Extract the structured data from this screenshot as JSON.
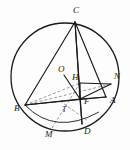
{
  "figure": {
    "kind": "geometry-diagram",
    "background_color": "#fdfdfd",
    "stroke_color": "#1a1a1a",
    "dashed_color": "#7a7a7a",
    "width": 130,
    "height": 150
  },
  "circle": {
    "name": "circumcircle",
    "cx": 65,
    "cy": 77,
    "r": 54,
    "stroke_width": 1.3
  },
  "points": [
    {
      "id": "C",
      "label": "C",
      "x": 75,
      "y": 22,
      "lx": 73,
      "ly": 13,
      "on_circle": true
    },
    {
      "id": "N",
      "label": "N",
      "x": 111,
      "y": 84,
      "lx": 114,
      "ly": 79,
      "on_circle": false
    },
    {
      "id": "A",
      "label": "A",
      "x": 106,
      "y": 97,
      "lx": 110,
      "ly": 103,
      "on_circle": true
    },
    {
      "id": "B",
      "label": "B",
      "x": 25,
      "y": 105,
      "lx": 14,
      "ly": 111,
      "on_circle": true
    },
    {
      "id": "D",
      "label": "D",
      "x": 82,
      "y": 124,
      "lx": 84,
      "ly": 134,
      "on_circle": true
    },
    {
      "id": "M",
      "label": "M",
      "x": 52,
      "y": 128,
      "lx": 45,
      "ly": 137,
      "on_circle": true
    },
    {
      "id": "O",
      "label": "O",
      "x": 64,
      "y": 75,
      "lx": 58,
      "ly": 72,
      "on_circle": false
    },
    {
      "id": "H",
      "label": "H",
      "x": 80,
      "y": 83,
      "lx": 73,
      "ly": 80,
      "on_circle": false
    },
    {
      "id": "F",
      "label": "F",
      "x": 80,
      "y": 99,
      "lx": 84,
      "ly": 104,
      "on_circle": false
    },
    {
      "id": "T",
      "label": "T",
      "x": 68,
      "y": 106,
      "lx": 63,
      "ly": 112,
      "on_circle": false
    }
  ],
  "solid_segments": [
    {
      "name": "segment-C-B",
      "from": "C",
      "to": "B"
    },
    {
      "name": "segment-C-A",
      "from": "C",
      "to": "A"
    },
    {
      "name": "segment-C-D",
      "from": "C",
      "to": "D"
    },
    {
      "name": "segment-C-F",
      "from": "C",
      "to": "F"
    },
    {
      "name": "segment-B-A",
      "from": "B",
      "to": "A"
    },
    {
      "name": "segment-B-F",
      "from": "B",
      "to": "F"
    },
    {
      "name": "segment-F-A",
      "from": "F",
      "to": "A"
    },
    {
      "name": "segment-F-D",
      "from": "F",
      "to": "D"
    },
    {
      "name": "segment-F-N",
      "from": "F",
      "to": "N"
    },
    {
      "name": "segment-H-N",
      "from": "H",
      "to": "N"
    },
    {
      "name": "segment-H-F",
      "from": "H",
      "to": "F"
    },
    {
      "name": "segment-O-F",
      "from": "O",
      "to": "F"
    }
  ],
  "dashed_segments": [
    {
      "name": "dashed-B-H",
      "from": "B",
      "to": "H"
    },
    {
      "name": "dashed-B-N",
      "from": "B",
      "to": "N"
    },
    {
      "name": "dashed-T-D",
      "from": "T",
      "to": "D"
    },
    {
      "name": "dashed-M-H",
      "from": "M",
      "to": "H"
    },
    {
      "name": "dashed-B-T",
      "from": "B",
      "to": "T"
    }
  ],
  "arcs": [
    {
      "name": "arc-B-M-D",
      "note": "lower chord-like arc through M between B and D"
    }
  ]
}
